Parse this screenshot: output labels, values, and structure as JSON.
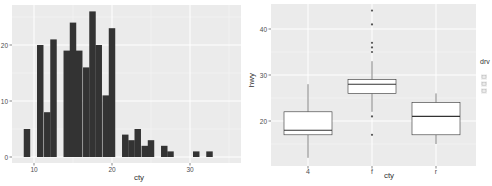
{
  "chart_data": [
    {
      "type": "bar",
      "subtype": "histogram",
      "title": "",
      "xlabel": "cty",
      "ylabel": "",
      "x_ticks": [
        10,
        20,
        30
      ],
      "y_ticks": [
        0,
        10,
        20
      ],
      "xlim": [
        8,
        36
      ],
      "ylim": [
        0,
        27
      ],
      "grid": true,
      "bin_width": 0.83,
      "bins": [
        {
          "x": 9.1,
          "count": 5
        },
        {
          "x": 10.8,
          "count": 20
        },
        {
          "x": 11.7,
          "count": 8
        },
        {
          "x": 12.5,
          "count": 21
        },
        {
          "x": 14.2,
          "count": 19
        },
        {
          "x": 15.0,
          "count": 24
        },
        {
          "x": 15.8,
          "count": 19
        },
        {
          "x": 16.7,
          "count": 16
        },
        {
          "x": 17.5,
          "count": 26
        },
        {
          "x": 18.3,
          "count": 20
        },
        {
          "x": 19.2,
          "count": 11
        },
        {
          "x": 20.0,
          "count": 23
        },
        {
          "x": 21.7,
          "count": 4
        },
        {
          "x": 22.5,
          "count": 3
        },
        {
          "x": 23.3,
          "count": 5
        },
        {
          "x": 24.2,
          "count": 2
        },
        {
          "x": 25.0,
          "count": 3
        },
        {
          "x": 26.7,
          "count": 2
        },
        {
          "x": 27.5,
          "count": 1
        },
        {
          "x": 30.8,
          "count": 1
        },
        {
          "x": 32.5,
          "count": 1
        }
      ],
      "bar_color": "#333333",
      "panel_background": "#ebebeb"
    },
    {
      "type": "box",
      "title": "",
      "xlabel": "cty",
      "ylabel": "hwy",
      "categories": [
        "4",
        "f",
        "r"
      ],
      "y_ticks": [
        20,
        30,
        40
      ],
      "ylim": [
        11,
        45
      ],
      "grid": true,
      "legend": {
        "title": "drv",
        "position": "right",
        "entries": [
          "4",
          "f",
          "r"
        ]
      },
      "boxes": [
        {
          "category": "4",
          "whisker_low": 12,
          "q1": 17,
          "median": 18,
          "q3": 22,
          "whisker_high": 28,
          "outliers": []
        },
        {
          "category": "f",
          "whisker_low": 22,
          "q1": 26,
          "median": 28,
          "q3": 29,
          "whisker_high": 33,
          "outliers": [
            17,
            21,
            35,
            36,
            37,
            41,
            44
          ]
        },
        {
          "category": "r",
          "whisker_low": 15,
          "q1": 17,
          "median": 21,
          "q3": 24,
          "whisker_high": 26,
          "outliers": []
        }
      ],
      "box_fill": "#ffffff",
      "box_line": "#333333",
      "panel_background": "#ebebeb"
    }
  ],
  "labels": {
    "hist_x": "cty",
    "hist_ticks_x": [
      "10",
      "20",
      "30"
    ],
    "hist_ticks_y": [
      "0",
      "10",
      "20"
    ],
    "box_x": "cty",
    "box_y": "hwy",
    "box_ticks_y": [
      "20",
      "30",
      "40"
    ],
    "box_cats": [
      "4",
      "f",
      "r"
    ],
    "legend_title": "drv"
  }
}
